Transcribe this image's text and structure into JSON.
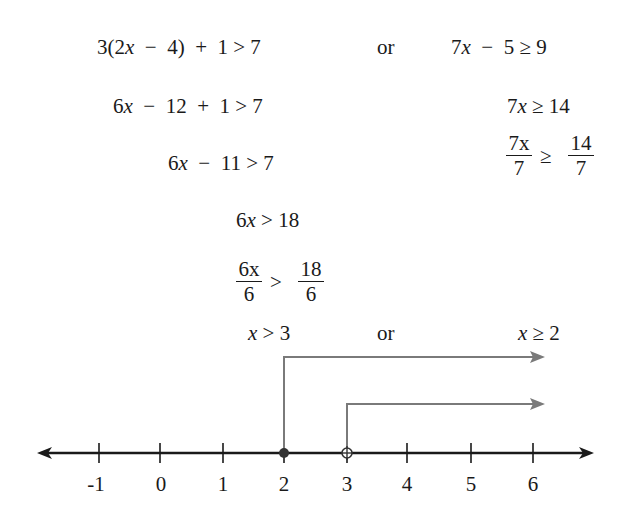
{
  "left_steps": [
    "3(2x − 4) + 1 > 7",
    "6x − 12 + 1 > 7",
    "6x − 11 > 7",
    "6x > 18"
  ],
  "left_fraction_step": {
    "lhs_num": "6x",
    "lhs_den": "6",
    "op": ">",
    "rhs_num": "18",
    "rhs_den": "6"
  },
  "left_result": "x > 3",
  "connector": "or",
  "right_steps": [
    "7x − 5 ≥ 9",
    "7x ≥ 14"
  ],
  "right_fraction_step": {
    "lhs_num": "7x",
    "lhs_den": "7",
    "op": "≥",
    "rhs_num": "14",
    "rhs_den": "7"
  },
  "right_result": "x ≥ 2",
  "number_line": {
    "ticks": [
      "-1",
      "0",
      "1",
      "2",
      "3",
      "4",
      "5",
      "6"
    ],
    "closed_point": "2",
    "open_point": "3",
    "axis_color": "#1a1a1a",
    "ray_color": "#7a7a7a"
  }
}
